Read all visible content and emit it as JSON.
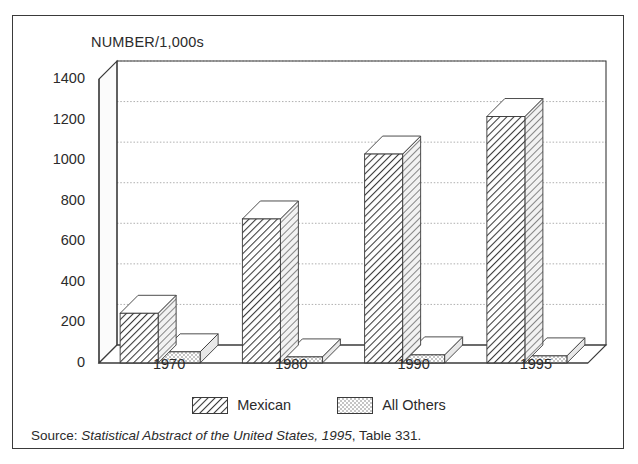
{
  "figure": {
    "axis_title": "NUMBER/1,000s",
    "source_prefix": "Source:",
    "source_italic": "Statistical Abstract of the United States, 1995",
    "source_suffix": ", Table 331."
  },
  "legend": {
    "items": [
      {
        "label": "Mexican",
        "pattern": "diagonal-hatch",
        "color": "#333333"
      },
      {
        "label": "All Others",
        "pattern": "stipple-dots",
        "color": "#555555"
      }
    ]
  },
  "chart_data": {
    "type": "bar",
    "title": "",
    "subtitle": "",
    "xlabel": "",
    "ylabel": "NUMBER/1,000s",
    "categories": [
      "1970",
      "1980",
      "1990",
      "1995"
    ],
    "series": [
      {
        "name": "Mexican",
        "values": [
          245,
          710,
          1030,
          1215
        ]
      },
      {
        "name": "All Others",
        "values": [
          55,
          30,
          40,
          35
        ]
      }
    ],
    "ylim": [
      0,
      1400
    ],
    "yticks": [
      0,
      200,
      400,
      600,
      800,
      1000,
      1200,
      1400
    ],
    "ytick_labels": [
      "0",
      "200",
      "400",
      "600",
      "800",
      "1000",
      "1200",
      "1400"
    ],
    "grid": true,
    "grid_axis": "y",
    "legend_position": "bottom",
    "style": "3d-bars-monochrome"
  }
}
